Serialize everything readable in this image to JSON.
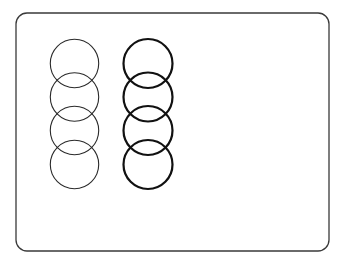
{
  "canvas": {
    "width": 346,
    "height": 266,
    "background": "#ffffff"
  },
  "frame": {
    "x": 16,
    "y": 13,
    "width": 313,
    "height": 238,
    "radius": 11,
    "stroke": "#3a3a3a",
    "stroke_width": 1.3
  },
  "columns": [
    {
      "name": "thin-circles",
      "cx": 74.5,
      "radius": 24.2,
      "stroke": "#2a2a2a",
      "stroke_width": 1.1,
      "centers_y": [
        63.5,
        97,
        130.5,
        164.5
      ]
    },
    {
      "name": "thick-circles",
      "cx": 148,
      "radius": 24.5,
      "stroke": "#111111",
      "stroke_width": 2.2,
      "centers_y": [
        63.5,
        97,
        130.5,
        164.5
      ]
    }
  ]
}
